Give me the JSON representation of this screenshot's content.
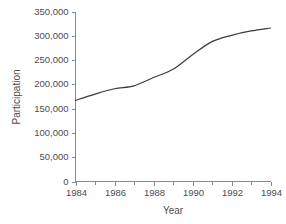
{
  "chart_data": {
    "type": "line",
    "title": "",
    "xlabel": "Year",
    "ylabel": "Participation",
    "xlim": [
      1984,
      1994
    ],
    "ylim": [
      0,
      350000
    ],
    "grid": false,
    "legend": null,
    "x_tick_labels": [
      "1984",
      "1986",
      "1988",
      "1990",
      "1992",
      "1994"
    ],
    "x_tick_values": [
      1984,
      1986,
      1988,
      1990,
      1992,
      1994
    ],
    "x_minor_ticks": [
      1985,
      1987,
      1989,
      1991,
      1993
    ],
    "y_tick_labels": [
      "0",
      "50,000",
      "100,000",
      "150,000",
      "200,000",
      "250,000",
      "300,000",
      "350,000"
    ],
    "y_tick_values": [
      0,
      50000,
      100000,
      150000,
      200000,
      250000,
      300000,
      350000
    ],
    "line_color": "#3a3a3a",
    "axis_color": "#8a8a8a",
    "background_color": "#ffffff",
    "x": [
      1984,
      1985,
      1986,
      1987,
      1988,
      1989,
      1990,
      1991,
      1992,
      1993,
      1994
    ],
    "values": [
      167000,
      180000,
      191000,
      197000,
      214000,
      231000,
      261000,
      288000,
      301000,
      310000,
      316000
    ],
    "series": [
      {
        "name": "Participation",
        "values": [
          167000,
          180000,
          191000,
          197000,
          214000,
          231000,
          261000,
          288000,
          301000,
          310000,
          316000
        ]
      }
    ]
  }
}
